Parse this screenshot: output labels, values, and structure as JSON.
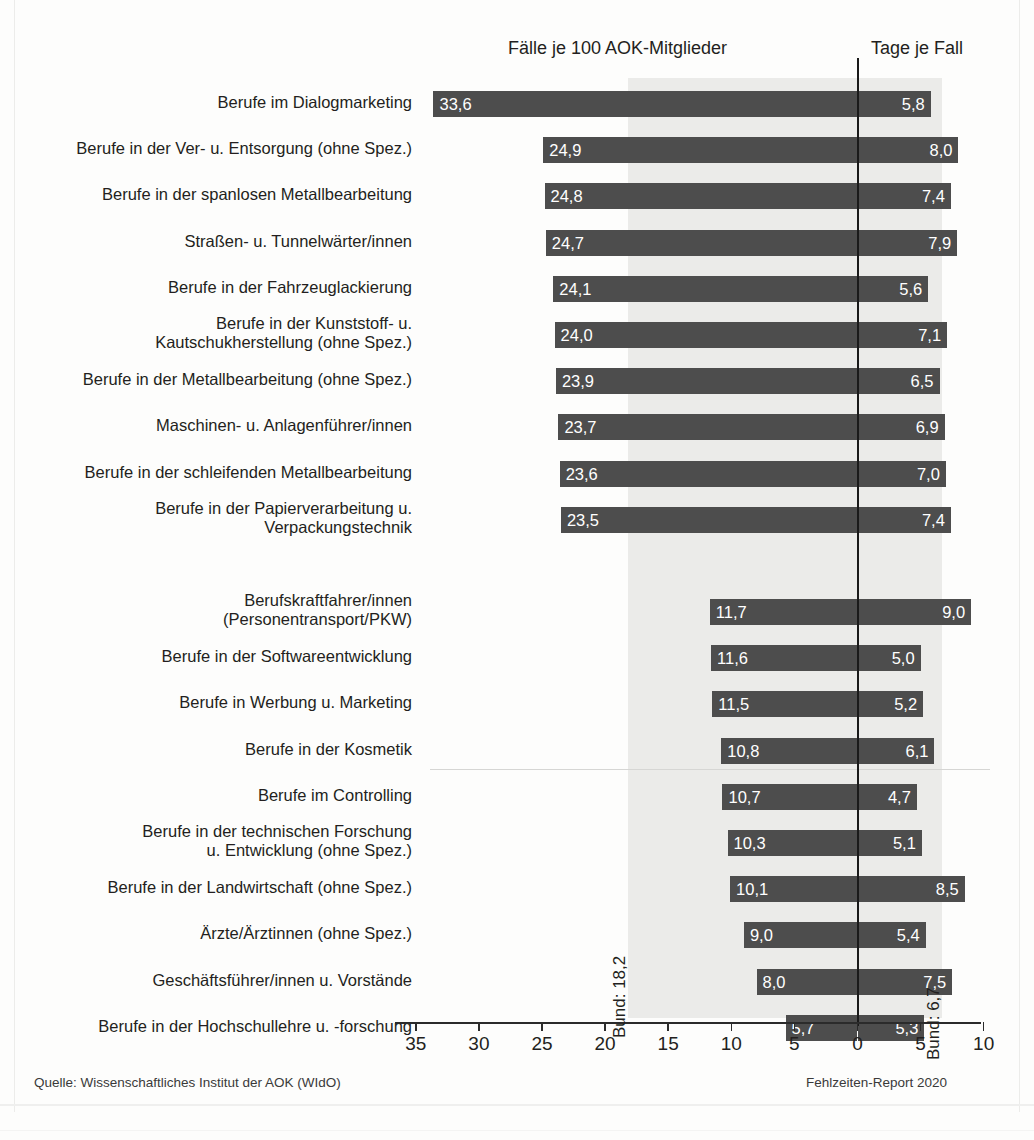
{
  "header": {
    "left_title": "Fälle je 100 AOK-Mitglieder",
    "right_title": "Tage je Fall"
  },
  "footer": {
    "source": "Quelle: Wissenschaftliches Institut der AOK (WIdO)",
    "report": "Fehlzeiten-Report 2020"
  },
  "annotations": {
    "bund_left": "Bund: 18,2",
    "bund_right": "Bund: 6,7"
  },
  "colors": {
    "bar": "#4d4d4d",
    "band": "#ebebe9",
    "zero_line": "#1a1a1a",
    "text": "#231f20",
    "value_text": "#ffffff"
  },
  "chart_data": {
    "type": "bar",
    "subtype": "diverging-horizontal",
    "title": "",
    "xlabel": "",
    "ylabel": "",
    "grid": false,
    "legend": "none",
    "left_axis": {
      "label": "Fälle je 100 AOK-Mitglieder",
      "ticks": [
        35,
        30,
        25,
        20,
        15,
        10,
        5,
        0
      ],
      "tick_labels": [
        "35",
        "30",
        "25",
        "20",
        "15",
        "10",
        "5",
        "0"
      ],
      "range": [
        35,
        0
      ],
      "reference_line": 18.2,
      "reference_label": "Bund: 18,2"
    },
    "right_axis": {
      "label": "Tage je Fall",
      "ticks": [
        0,
        5,
        10
      ],
      "tick_labels": [
        "0",
        "5",
        "10"
      ],
      "range": [
        0,
        10
      ],
      "reference_line": 6.7,
      "reference_label": "Bund: 6,7"
    },
    "categories": [
      "Berufe im Dialogmarketing",
      "Berufe in der Ver- u. Entsorgung (ohne Spez.)",
      "Berufe in der spanlosen Metallbearbeitung",
      "Straßen- u. Tunnelwärter/innen",
      "Berufe in der Fahrzeuglackierung",
      "Berufe in der Kunststoff- u. Kautschukherstellung (ohne Spez.)",
      "Berufe in der Metallbearbeitung (ohne Spez.)",
      "Maschinen- u. Anlagenführer/innen",
      "Berufe in der schleifenden Metallbearbeitung",
      "Berufe in der Papierverarbeitung u. Verpackungstechnik",
      "Berufskraftfahrer/innen (Personentransport/PKW)",
      "Berufe in der Softwareentwicklung",
      "Berufe in Werbung u. Marketing",
      "Berufe in der Kosmetik",
      "Berufe im Controlling",
      "Berufe in der technischen Forschung u. Entwicklung (ohne Spez.)",
      "Berufe in der Landwirtschaft (ohne Spez.)",
      "Ärzte/Ärztinnen (ohne Spez.)",
      "Geschäftsführer/innen u. Vorstände",
      "Berufe in der Hochschullehre u. -forschung"
    ],
    "series": [
      {
        "name": "Fälle je 100 AOK-Mitglieder",
        "values": [
          33.6,
          24.9,
          24.8,
          24.7,
          24.1,
          24.0,
          23.9,
          23.7,
          23.6,
          23.5,
          11.7,
          11.6,
          11.5,
          10.8,
          10.7,
          10.3,
          10.1,
          9.0,
          8.0,
          5.7
        ]
      },
      {
        "name": "Tage je Fall",
        "values": [
          5.8,
          8.0,
          7.4,
          7.9,
          5.6,
          7.1,
          6.5,
          6.9,
          7.0,
          7.4,
          9.0,
          5.0,
          5.2,
          6.1,
          4.7,
          5.1,
          8.5,
          5.4,
          7.5,
          5.3
        ]
      }
    ]
  },
  "rows": [
    {
      "label_lines": [
        "Berufe im Dialogmarketing"
      ],
      "left": "33,6",
      "right": "5,8"
    },
    {
      "label_lines": [
        "Berufe in der Ver- u. Entsorgung (ohne Spez.)"
      ],
      "left": "24,9",
      "right": "8,0"
    },
    {
      "label_lines": [
        "Berufe in der spanlosen Metallbearbeitung"
      ],
      "left": "24,8",
      "right": "7,4"
    },
    {
      "label_lines": [
        "Straßen- u. Tunnelwärter/innen"
      ],
      "left": "24,7",
      "right": "7,9"
    },
    {
      "label_lines": [
        "Berufe in der Fahrzeuglackierung"
      ],
      "left": "24,1",
      "right": "5,6"
    },
    {
      "label_lines": [
        "Berufe in der Kunststoff- u.",
        "Kautschukherstellung (ohne Spez.)"
      ],
      "left": "24,0",
      "right": "7,1"
    },
    {
      "label_lines": [
        "Berufe in der Metallbearbeitung (ohne Spez.)"
      ],
      "left": "23,9",
      "right": "6,5"
    },
    {
      "label_lines": [
        "Maschinen- u. Anlagenführer/innen"
      ],
      "left": "23,7",
      "right": "6,9"
    },
    {
      "label_lines": [
        "Berufe in der schleifenden Metallbearbeitung"
      ],
      "left": "23,6",
      "right": "7,0"
    },
    {
      "label_lines": [
        "Berufe in der Papierverarbeitung u.",
        "Verpackungstechnik"
      ],
      "left": "23,5",
      "right": "7,4"
    },
    {
      "label_lines": [
        "Berufskraftfahrer/innen",
        "(Personentransport/PKW)"
      ],
      "left": "11,7",
      "right": "9,0"
    },
    {
      "label_lines": [
        "Berufe in der Softwareentwicklung"
      ],
      "left": "11,6",
      "right": "5,0"
    },
    {
      "label_lines": [
        "Berufe in Werbung u. Marketing"
      ],
      "left": "11,5",
      "right": "5,2"
    },
    {
      "label_lines": [
        "Berufe in der Kosmetik"
      ],
      "left": "10,8",
      "right": "6,1"
    },
    {
      "label_lines": [
        "Berufe im Controlling"
      ],
      "left": "10,7",
      "right": "4,7"
    },
    {
      "label_lines": [
        "Berufe in der technischen Forschung",
        "u. Entwicklung (ohne Spez.)"
      ],
      "left": "10,3",
      "right": "5,1"
    },
    {
      "label_lines": [
        "Berufe in der Landwirtschaft (ohne Spez.)"
      ],
      "left": "10,1",
      "right": "8,5"
    },
    {
      "label_lines": [
        "Ärzte/Ärztinnen (ohne Spez.)"
      ],
      "left": "9,0",
      "right": "5,4"
    },
    {
      "label_lines": [
        "Geschäftsführer/innen u. Vorstände"
      ],
      "left": "8,0",
      "right": "7,5"
    },
    {
      "label_lines": [
        "Berufe in der Hochschullehre u. -forschung"
      ],
      "left": "5,7",
      "right": "5,3"
    }
  ],
  "axis_ticks": [
    {
      "label": "35",
      "value": -35
    },
    {
      "label": "30",
      "value": -30
    },
    {
      "label": "25",
      "value": -25
    },
    {
      "label": "20",
      "value": -20
    },
    {
      "label": "15",
      "value": -15
    },
    {
      "label": "10",
      "value": -10
    },
    {
      "label": "5",
      "value": -5
    },
    {
      "label": "0",
      "value": 0
    },
    {
      "label": "5",
      "value": 5
    },
    {
      "label": "10",
      "value": 10
    }
  ]
}
